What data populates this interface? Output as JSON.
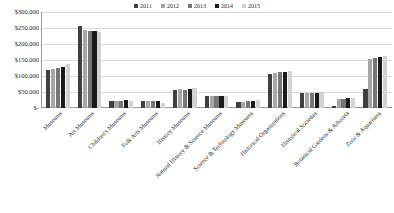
{
  "chart_data": {
    "type": "bar",
    "title": "",
    "subtitle": "",
    "xlabel": "",
    "ylabel": "",
    "grid": true,
    "legend_position": "top-center",
    "ylim": [
      0,
      300000
    ],
    "ytick_labels": [
      "$300,000",
      "$250,000",
      "$200,000",
      "$150,000",
      "$100,000",
      "$50,000",
      "$-"
    ],
    "ytick_values": [
      300000,
      250000,
      200000,
      150000,
      100000,
      50000,
      0
    ],
    "categories": [
      "Museums",
      "Art Museums",
      "Children's Museums",
      "Folk Arts Museums",
      "History Museums",
      "Natural History & Science Museums",
      "Science & Technology  Museums",
      "Historical Organizations",
      "Historical Societies",
      "Botanical Gardens & Arboreta",
      "Zoos & Aquariums"
    ],
    "series": [
      {
        "name": "2011",
        "color": "#3f3f3f",
        "values": [
          118000,
          257000,
          22000,
          22000,
          57000,
          36000,
          18000,
          105000,
          47000,
          5000,
          60000
        ]
      },
      {
        "name": "2012",
        "color": "#a6a6a6",
        "values": [
          121000,
          244000,
          23000,
          23000,
          58000,
          39000,
          20000,
          110000,
          48000,
          28000,
          153000
        ]
      },
      {
        "name": "2013",
        "color": "#767676",
        "values": [
          124000,
          241000,
          23000,
          22000,
          57000,
          39000,
          21000,
          113000,
          48000,
          29000,
          157000
        ]
      },
      {
        "name": "2014",
        "color": "#1a1a1a",
        "values": [
          128000,
          241000,
          24000,
          21000,
          58000,
          38000,
          22000,
          114000,
          48000,
          32000,
          158000
        ]
      },
      {
        "name": "2015",
        "color": "#d2d2d2",
        "values": [
          137000,
          236000,
          22000,
          16000,
          62000,
          37000,
          25000,
          117000,
          49000,
          31000,
          164000
        ]
      }
    ]
  }
}
